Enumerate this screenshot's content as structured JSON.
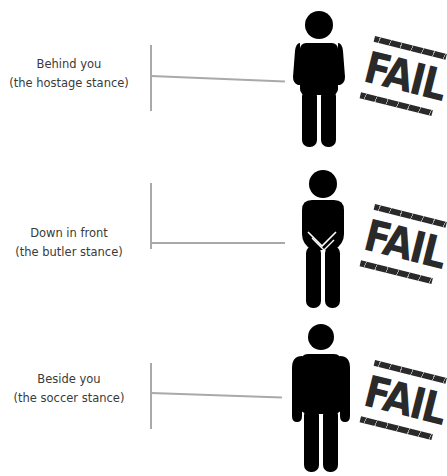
{
  "stamp_text": "FAIL",
  "colors": {
    "figure": "#000000",
    "line": "#a9a9a9",
    "text": "#3a3a3a",
    "stamp": "#2a2a2a"
  },
  "rows": [
    {
      "label": "Behind you",
      "sublabel": "(the hostage stance)",
      "pose": "hands-behind",
      "verdict": "FAIL"
    },
    {
      "label": "Down in front",
      "sublabel": "(the butler stance)",
      "pose": "hands-clasped-front",
      "verdict": "FAIL"
    },
    {
      "label": "Beside you",
      "sublabel": "(the soccer stance)",
      "pose": "arms-at-sides",
      "verdict": "FAIL"
    }
  ]
}
